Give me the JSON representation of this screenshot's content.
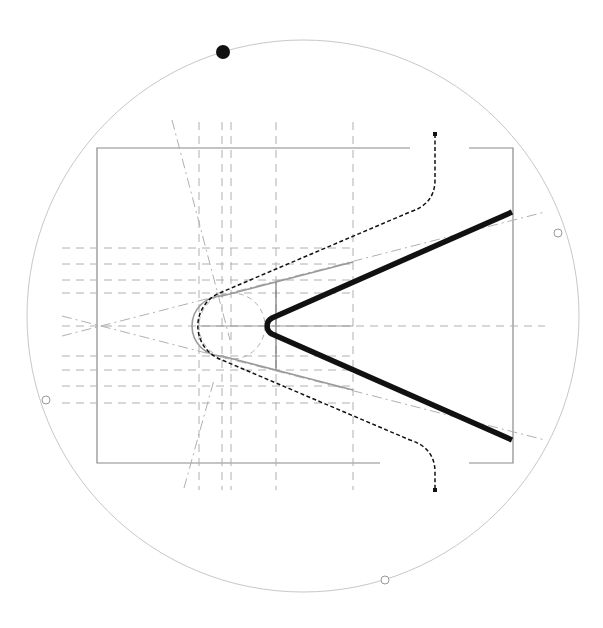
{
  "diagram": {
    "title": "",
    "colors": {
      "background": "#ffffff",
      "circle": "#c8c8c8",
      "frame": "#8a8a8a",
      "guide": "#b0b0b0",
      "offset_profile": "#9a9a9a",
      "dashed_path": "#111111",
      "main_profile": "#111111",
      "handle_fill": "#111111",
      "handle_hollow": "#ffffff"
    },
    "elements": [
      {
        "name": "bounding-circle",
        "kind": "circle"
      },
      {
        "name": "frame-rectangle",
        "kind": "open-rectangle"
      },
      {
        "name": "horizontal-guides",
        "kind": "dashed-lines",
        "count": 9
      },
      {
        "name": "vertical-guides",
        "kind": "dashed-lines",
        "count": 6
      },
      {
        "name": "diagonal-guides",
        "kind": "dash-dot-lines",
        "count": 4
      },
      {
        "name": "construction-circle",
        "kind": "dashed-circle"
      },
      {
        "name": "outer-dashed-path",
        "kind": "dashed-curve"
      },
      {
        "name": "offset-profile",
        "kind": "gray-v-profile"
      },
      {
        "name": "main-profile",
        "kind": "thick-v-profile"
      },
      {
        "name": "filled-handle",
        "kind": "handle"
      },
      {
        "name": "hollow-handles",
        "kind": "handle",
        "count": 3
      }
    ]
  }
}
